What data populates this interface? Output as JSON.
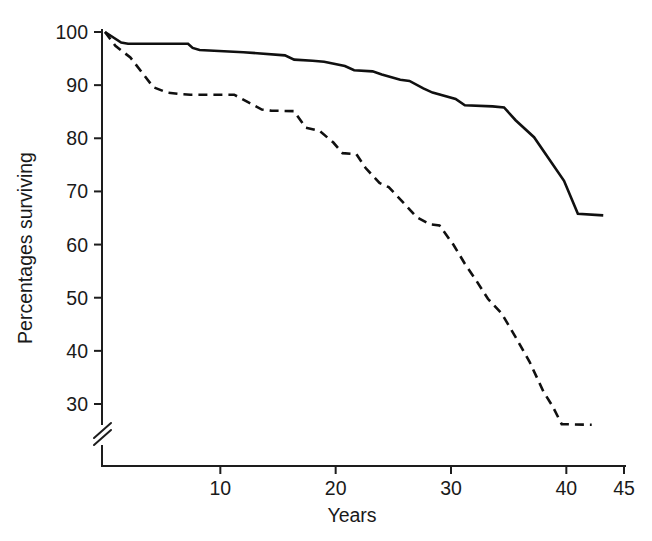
{
  "chart_data": {
    "type": "line",
    "title": "",
    "subtitle": "",
    "xlabel": "Years",
    "ylabel": "Percentages surviving",
    "xlim": [
      0,
      45
    ],
    "ylim": [
      25,
      100
    ],
    "grid": false,
    "legend": "none",
    "axis_break": {
      "axis": "y",
      "below_value": 28,
      "note": "double-slash break on y-axis below the 30 tick"
    },
    "xticks": [
      10,
      20,
      30,
      40,
      45
    ],
    "xtick_labels": [
      "10",
      "20",
      "30",
      "40",
      "45"
    ],
    "yticks": [
      30,
      40,
      50,
      60,
      70,
      80,
      90,
      100
    ],
    "ytick_labels": [
      "30",
      "40",
      "50",
      "60",
      "70",
      "80",
      "90",
      "100"
    ],
    "annotations": [],
    "series": [
      {
        "name": "solid-curve",
        "style": "solid",
        "color": "#101010",
        "x": [
          0,
          1.4,
          2.0,
          7.2,
          7.6,
          8.2,
          12.0,
          15.6,
          16.4,
          18.0,
          19.0,
          20.8,
          21.6,
          23.2,
          24.0,
          25.6,
          26.4,
          27.6,
          28.4,
          30.4,
          31.2,
          33.6,
          34.6,
          35.6,
          37.2,
          39.8,
          41.0,
          43.2
        ],
        "y": [
          100.0,
          98.0,
          97.8,
          97.8,
          97.0,
          96.6,
          96.2,
          95.6,
          94.8,
          94.6,
          94.4,
          93.6,
          92.8,
          92.6,
          92.0,
          91.0,
          90.8,
          89.4,
          88.6,
          87.4,
          86.2,
          86.0,
          85.8,
          83.4,
          80.2,
          72.0,
          65.8,
          65.5
        ]
      },
      {
        "name": "dashed-curve",
        "style": "dashed",
        "color": "#101010",
        "x": [
          0,
          0.9,
          2.2,
          3.2,
          4.2,
          5.4,
          6.6,
          7.4,
          11.2,
          12.4,
          13.6,
          14.4,
          16.4,
          17.4,
          18.6,
          19.8,
          20.6,
          21.8,
          22.6,
          23.8,
          24.6,
          26.0,
          27.0,
          28.2,
          29.0,
          30.2,
          31.2,
          32.2,
          33.2,
          34.4,
          35.6,
          36.8,
          38.0,
          38.8,
          39.6,
          42.2
        ],
        "y": [
          100.0,
          97.4,
          95.2,
          92.4,
          89.6,
          88.6,
          88.3,
          88.2,
          88.2,
          86.8,
          85.4,
          85.2,
          85.1,
          82.0,
          81.4,
          79.2,
          77.2,
          77.0,
          74.4,
          71.6,
          70.8,
          67.6,
          65.2,
          63.8,
          63.6,
          60.0,
          56.4,
          53.2,
          49.8,
          47.0,
          42.6,
          38.0,
          32.4,
          29.6,
          26.2,
          26.1
        ]
      }
    ]
  },
  "axes": {
    "y_axis_label": "Percentages surviving",
    "x_axis_label": "Years"
  }
}
